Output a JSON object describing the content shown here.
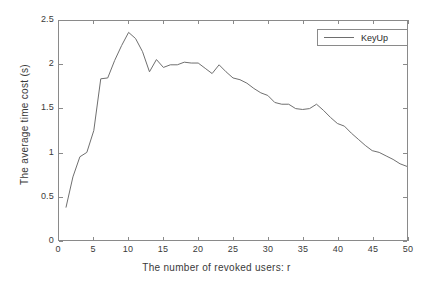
{
  "chart_data": {
    "type": "line",
    "title": "",
    "xlabel": "The number of revoked users: r",
    "ylabel": "The average time cost (s)",
    "xlim": [
      0,
      50
    ],
    "ylim": [
      0,
      2.5
    ],
    "xticks": [
      0,
      5,
      10,
      15,
      20,
      25,
      30,
      35,
      40,
      45,
      50
    ],
    "yticks": [
      0,
      0.5,
      1,
      1.5,
      2,
      2.5
    ],
    "xtick_labels": [
      "0",
      "5",
      "10",
      "15",
      "20",
      "25",
      "30",
      "35",
      "40",
      "45",
      "50"
    ],
    "ytick_labels": [
      "0",
      "0.5",
      "1",
      "1.5",
      "2",
      "2.5"
    ],
    "grid": false,
    "legend_position": "top-right",
    "line_color": "#6e6e6e",
    "series": [
      {
        "name": "KeyUp",
        "x": [
          1,
          2,
          3,
          4,
          5,
          6,
          7,
          8,
          9,
          10,
          11,
          12,
          13,
          14,
          15,
          16,
          17,
          18,
          19,
          20,
          21,
          22,
          23,
          24,
          25,
          26,
          27,
          28,
          29,
          30,
          31,
          32,
          33,
          34,
          35,
          36,
          37,
          38,
          39,
          40,
          41,
          42,
          43,
          44,
          45,
          46,
          47,
          48,
          49,
          50
        ],
        "values": [
          0.37,
          0.72,
          0.95,
          1.0,
          1.25,
          1.84,
          1.85,
          2.05,
          2.22,
          2.37,
          2.3,
          2.15,
          1.92,
          2.06,
          1.97,
          2.0,
          2.0,
          2.03,
          2.02,
          2.02,
          1.96,
          1.9,
          2.0,
          1.92,
          1.85,
          1.83,
          1.79,
          1.73,
          1.68,
          1.65,
          1.57,
          1.55,
          1.55,
          1.5,
          1.49,
          1.5,
          1.55,
          1.48,
          1.4,
          1.33,
          1.3,
          1.22,
          1.15,
          1.08,
          1.02,
          1.0,
          0.96,
          0.92,
          0.87,
          0.84
        ]
      }
    ]
  },
  "legend": {
    "entries": [
      {
        "label": "KeyUp"
      }
    ]
  }
}
